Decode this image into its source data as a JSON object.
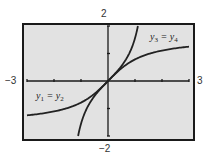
{
  "chart_data": {
    "type": "line",
    "title": "",
    "xlabel": "",
    "ylabel": "",
    "xlim": [
      -3,
      3
    ],
    "ylim": [
      -2,
      2
    ],
    "grid": false,
    "x_tick_step": 1,
    "y_tick_step": 1,
    "window_labels": {
      "xmin": "−3",
      "xmax": "3",
      "ymax": "2",
      "ymin": "−2"
    },
    "series": [
      {
        "name": "y1 = y2",
        "function": "arctan(x)",
        "x": [
          -3,
          -2.5,
          -2,
          -1.5,
          -1,
          -0.5,
          0,
          0.5,
          1,
          1.5,
          2,
          2.5,
          3
        ],
        "y": [
          -1.249,
          -1.19,
          -1.107,
          -0.983,
          -0.785,
          -0.464,
          0,
          0.464,
          0.785,
          0.983,
          1.107,
          1.19,
          1.249
        ]
      },
      {
        "name": "y3 = y4",
        "function": "tan(x)",
        "x": [
          -1.107,
          -1.0,
          -0.8,
          -0.6,
          -0.4,
          -0.2,
          0,
          0.2,
          0.4,
          0.6,
          0.8,
          1.0,
          1.107
        ],
        "y": [
          -2.0,
          -1.557,
          -1.03,
          -0.684,
          -0.423,
          -0.203,
          0,
          0.203,
          0.423,
          0.684,
          1.03,
          1.557,
          2.0
        ]
      }
    ],
    "annotations": [
      {
        "text": "y1 = y2",
        "near_series": "arctan(x)",
        "position": "lower-left"
      },
      {
        "text": "y3 = y4",
        "near_series": "tan(x)",
        "position": "upper-right"
      }
    ]
  },
  "labels": {
    "xmin": "−3",
    "xmax": "3",
    "ymax": "2",
    "ymin": "−2",
    "left_curve": {
      "var": "y",
      "sub_a": "1",
      "eq": " = ",
      "var_b": "y",
      "sub_b": "2"
    },
    "right_curve": {
      "var": "y",
      "sub_a": "3",
      "eq": " = ",
      "var_b": "y",
      "sub_b": "4"
    }
  },
  "colors": {
    "screen_bg": "#e2e2e2",
    "frame": "#1a1a1a",
    "axis": "#1a1a1a",
    "curve": "#222222",
    "page_bg": "#ffffff"
  }
}
